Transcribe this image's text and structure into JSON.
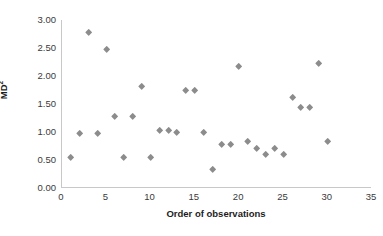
{
  "chart_data": {
    "type": "scatter",
    "title": "",
    "xlabel": "Order of observations",
    "ylabel": "MD²",
    "ylabel_base": "MD",
    "ylabel_sup": "2",
    "xlim": [
      0,
      35
    ],
    "ylim": [
      0.0,
      3.0
    ],
    "xticks": [
      0,
      5,
      10,
      15,
      20,
      25,
      30,
      35
    ],
    "xtick_labels": [
      "0",
      "5",
      "10",
      "15",
      "20",
      "25",
      "30",
      "35"
    ],
    "yticks": [
      0.0,
      0.5,
      1.0,
      1.5,
      2.0,
      2.5,
      3.0
    ],
    "ytick_labels": [
      "0.00",
      "0.50",
      "1.00",
      "1.50",
      "2.00",
      "2.50",
      "3.00"
    ],
    "grid": false,
    "legend": false,
    "marker_shape": "diamond",
    "marker_color": "#8c8c8c",
    "axis_color": "#c8c8c8",
    "text_color": "#3a3a3a",
    "title_color": "#1d1d1d",
    "series": [
      {
        "name": "MD²",
        "x": [
          1,
          2,
          3,
          4,
          5,
          6,
          7,
          8,
          9,
          10,
          11,
          12,
          13,
          14,
          15,
          16,
          17,
          18,
          19,
          20,
          21,
          22,
          23,
          24,
          25,
          26,
          27,
          28,
          29,
          30
        ],
        "y": [
          0.55,
          0.97,
          2.77,
          0.97,
          2.47,
          1.28,
          0.54,
          1.28,
          1.81,
          0.54,
          1.02,
          1.02,
          0.99,
          1.73,
          1.74,
          0.99,
          0.33,
          0.78,
          0.78,
          2.16,
          0.83,
          0.7,
          0.6,
          0.7,
          0.6,
          1.61,
          1.44,
          1.44,
          2.22,
          0.83
        ]
      }
    ]
  }
}
